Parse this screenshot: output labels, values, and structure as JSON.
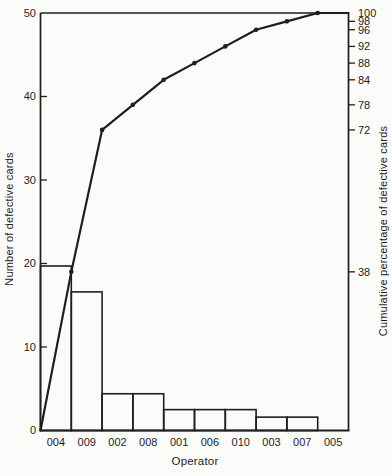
{
  "chart_data": {
    "type": "pareto",
    "title": "",
    "xlabel": "Operator",
    "ylabel_left": "Number of defective cards",
    "ylabel_right": "Cumulative percentage of defective cards",
    "categories": [
      "004",
      "009",
      "002",
      "008",
      "001",
      "006",
      "010",
      "003",
      "007",
      "005"
    ],
    "values": [
      19,
      17,
      3,
      3,
      2,
      2,
      2,
      1,
      1,
      0
    ],
    "bar_values_as_drawn": [
      19.7,
      16.6,
      4.4,
      4.4,
      2.5,
      2.5,
      2.5,
      1.6,
      1.6,
      0
    ],
    "cumulative_percent": [
      38,
      72,
      78,
      84,
      88,
      92,
      96,
      98,
      100,
      100
    ],
    "total_defectives": 50,
    "y_left": {
      "range": [
        0,
        50
      ],
      "ticks": [
        0,
        10,
        20,
        30,
        40,
        50
      ]
    },
    "y_right": {
      "range": [
        0,
        100
      ],
      "ticks": [
        38,
        72,
        78,
        84,
        88,
        92,
        96,
        98,
        100
      ]
    },
    "line": {
      "starts_at_origin": true,
      "markers": true,
      "ends_at_right_axis": true
    },
    "grid": false,
    "legend": "none",
    "colors": {
      "ink": "#1e1e1e",
      "paper": "#fbfbfa"
    }
  }
}
